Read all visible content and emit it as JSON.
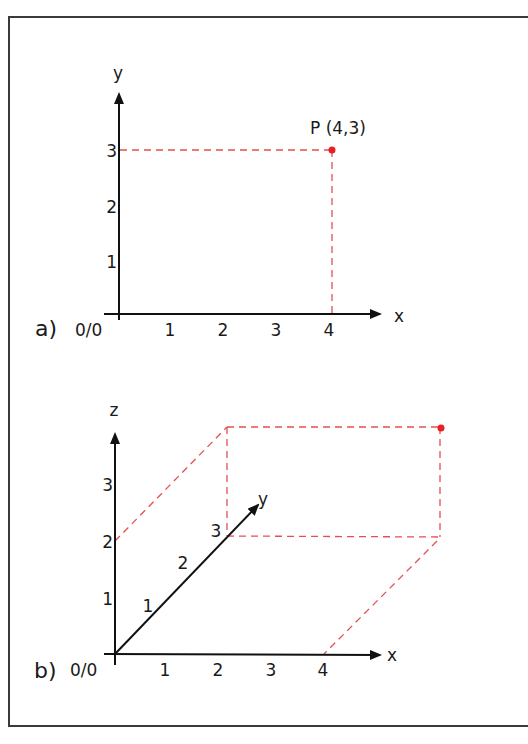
{
  "panel_a": {
    "label": "a)",
    "origin_label": "0/0",
    "x_axis_label": "x",
    "y_axis_label": "y",
    "x_ticks": [
      "1",
      "2",
      "3",
      "4"
    ],
    "y_ticks": [
      "1",
      "2",
      "3"
    ],
    "point_label": "P (4,3)",
    "point": {
      "x": 4,
      "y": 3
    },
    "point_color": "#e82020",
    "guide_color": "#e45050"
  },
  "panel_b": {
    "label": "b)",
    "origin_label": "0/0",
    "x_axis_label": "x",
    "y_axis_label": "y",
    "z_axis_label": "z",
    "x_ticks": [
      "1",
      "2",
      "3",
      "4"
    ],
    "y_ticks": [
      "1",
      "2",
      "3"
    ],
    "z_ticks": [
      "1",
      "2",
      "3"
    ],
    "point": {
      "x": 4,
      "y": 3,
      "z": 2
    },
    "point_color": "#e82020",
    "guide_color": "#e45050"
  }
}
